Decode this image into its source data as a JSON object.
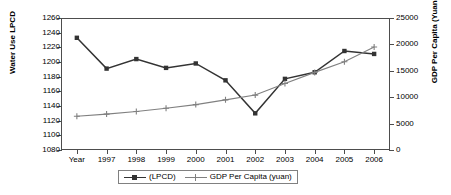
{
  "chart_data": {
    "type": "line",
    "title": "",
    "xlabel": "",
    "categories": [
      "Year",
      "1997",
      "1998",
      "1999",
      "2000",
      "2001",
      "2002",
      "2003",
      "2004",
      "2005",
      "2006"
    ],
    "grid": false,
    "legend_position": "bottom",
    "axes": {
      "left": {
        "label": "Water Use LPCD",
        "min": 1080,
        "max": 1260,
        "step": 20,
        "ticks": [
          "1080",
          "1100",
          "1120",
          "1140",
          "1160",
          "1180",
          "1200",
          "1220",
          "1240",
          "1260"
        ],
        "tick_values": [
          1080,
          1100,
          1120,
          1140,
          1160,
          1180,
          1200,
          1220,
          1240,
          1260
        ]
      },
      "right": {
        "label": "GDP Per Capita (Yuan)",
        "min": 0,
        "max": 25000,
        "step": 5000,
        "ticks": [
          "0",
          "5000",
          "10000",
          "15000",
          "20000",
          "25000"
        ],
        "tick_values": [
          0,
          5000,
          10000,
          15000,
          20000,
          25000
        ]
      }
    },
    "series": [
      {
        "name": "(LPCD)",
        "axis": "left",
        "marker": "square",
        "color": "#333333",
        "values": [
          1233,
          1191,
          1204,
          1192,
          1198,
          1175,
          1130,
          1177,
          1186,
          1215,
          1211
        ]
      },
      {
        "name": "GDP Per Capita (yuan)",
        "axis": "right",
        "marker": "plus",
        "color": "#808080",
        "values": [
          6400,
          6800,
          7300,
          7900,
          8600,
          9500,
          10400,
          12600,
          14700,
          16700,
          19500
        ]
      }
    ]
  },
  "legend": {
    "items": [
      {
        "label": "(LPCD)"
      },
      {
        "label": "GDP Per Capita (yuan)"
      }
    ]
  }
}
